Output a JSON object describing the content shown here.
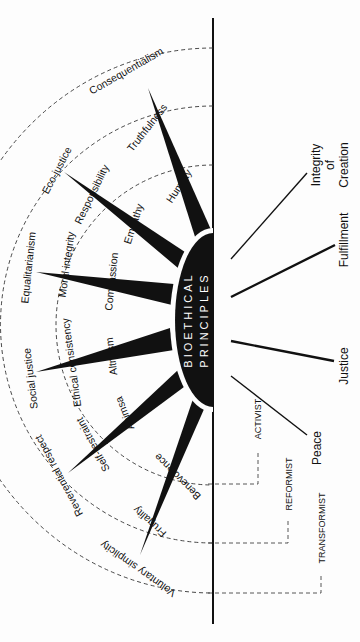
{
  "diagram": {
    "center_label": {
      "line1": "BIOETHICAL",
      "line2": "PRINCIPLES"
    },
    "rings": [
      {
        "level": "activist",
        "name": "Activist"
      },
      {
        "level": "reformist",
        "name": "Reformist"
      },
      {
        "level": "transformist",
        "name": "Transformist"
      }
    ],
    "inner_ring_labels": [
      "Humility",
      "Empathy",
      "Compassion",
      "Altruism",
      "Ahimsa",
      "Benevolence"
    ],
    "middle_ring_labels": [
      "Truthfulness",
      "Responsibility",
      "Moral integrity",
      "Ethical consistency",
      "Self-restraint",
      "Frugality"
    ],
    "outer_ring_labels": [
      "Consequentialism",
      "Eco-justice",
      "Equalitarianism",
      "Social justice",
      "Reverential respect",
      "Voluntary simplicity"
    ],
    "right_outcomes": [
      {
        "line1": "Integrity",
        "line2": "of",
        "line3": "Creation"
      },
      {
        "line1": "Fulfillment"
      },
      {
        "line1": "Justice"
      },
      {
        "line1": "Peace"
      }
    ],
    "level_labels": {
      "activist": "ACTIVIST",
      "reformist": "REFORMIST",
      "transformist": "TRANSFORMIST"
    },
    "colors": {
      "ink": "#111111",
      "background": "#fdfdfd",
      "dash": "#333333"
    }
  }
}
